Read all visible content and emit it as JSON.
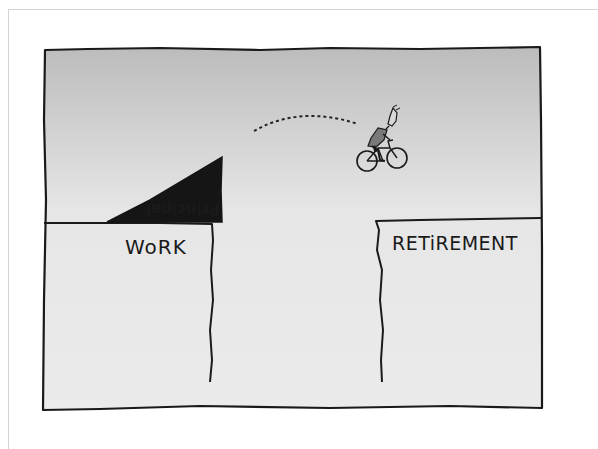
{
  "illustration": {
    "labels": {
      "work": "WoRK",
      "retirement": "RETiREMENT",
      "principal": "Principal"
    },
    "colors": {
      "background": "#ffffff",
      "panel_fill_top": "#bdbdbd",
      "panel_fill_bottom": "#ececec",
      "ink": "#1a1a1a",
      "outer_frame": "#d4d4d4"
    },
    "elements": {
      "left_cliff": "work-cliff",
      "right_cliff": "retirement-cliff",
      "ramp": "principal-ramp",
      "figure": "cyclist",
      "trajectory": "dotted-jump-arc"
    }
  }
}
